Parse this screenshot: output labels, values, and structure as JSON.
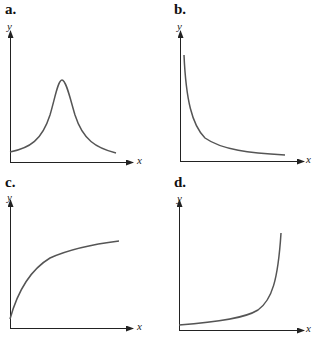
{
  "figure": {
    "panels": [
      {
        "id": "a",
        "label": "a.",
        "x_label": "x",
        "y_label": "y",
        "shape": "bell-shaped peak"
      },
      {
        "id": "b",
        "label": "b.",
        "x_label": "x",
        "y_label": "y",
        "shape": "decreasing, asymptotic to x-axis"
      },
      {
        "id": "c",
        "label": "c.",
        "x_label": "x",
        "y_label": "y",
        "shape": "increasing, concave down (saturating)"
      },
      {
        "id": "d",
        "label": "d.",
        "x_label": "x",
        "y_label": "y",
        "shape": "increasing, rising sharply at right"
      }
    ],
    "colors": {
      "axis": "#222222",
      "curve": "#555555",
      "text": "#111111"
    }
  }
}
